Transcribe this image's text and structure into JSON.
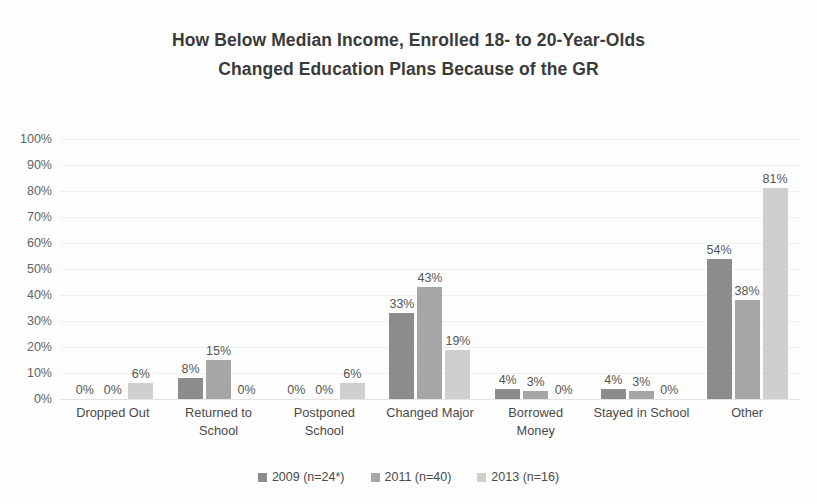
{
  "chart_data": {
    "type": "bar",
    "title": "How Below Median Income, Enrolled 18- to 20-Year-Olds Changed Education Plans Because of the GR",
    "title_lines": [
      "How Below Median Income, Enrolled 18- to 20-Year-Olds",
      "Changed Education Plans Because of the GR"
    ],
    "xlabel": "",
    "ylabel": "",
    "ylim": [
      0,
      100
    ],
    "y_ticks": [
      "100%",
      "90%",
      "80%",
      "70%",
      "60%",
      "50%",
      "40%",
      "30%",
      "20%",
      "10%",
      "0%"
    ],
    "y_tick_values": [
      100,
      90,
      80,
      70,
      60,
      50,
      40,
      30,
      20,
      10,
      0
    ],
    "grid": true,
    "legend_position": "bottom",
    "categories": [
      "Dropped Out",
      "Returned to School",
      "Postponed School",
      "Changed Major",
      "Borrowed Money",
      "Stayed in School",
      "Other"
    ],
    "category_lines": [
      [
        "Dropped Out"
      ],
      [
        "Returned to",
        "School"
      ],
      [
        "Postponed",
        "School"
      ],
      [
        "Changed Major"
      ],
      [
        "Borrowed",
        "Money"
      ],
      [
        "Stayed in School"
      ],
      [
        "Other"
      ]
    ],
    "series": [
      {
        "name": "2009 (n=24*)",
        "color": "#8c8c8c",
        "values": [
          0,
          8,
          0,
          33,
          4,
          4,
          54
        ],
        "labels": [
          "0%",
          "8%",
          "0%",
          "33%",
          "4%",
          "4%",
          "54%"
        ]
      },
      {
        "name": "2011 (n=40)",
        "color": "#a6a6a6",
        "values": [
          0,
          15,
          0,
          43,
          3,
          3,
          38
        ],
        "labels": [
          "0%",
          "15%",
          "0%",
          "43%",
          "3%",
          "3%",
          "38%"
        ]
      },
      {
        "name": "2013 (n=16)",
        "color": "#cfcfcf",
        "values": [
          6,
          0,
          6,
          19,
          0,
          0,
          81
        ],
        "labels": [
          "6%",
          "0%",
          "6%",
          "19%",
          "0%",
          "0%",
          "81%"
        ]
      }
    ]
  },
  "colors": {
    "series_2009": "#8c8c8c",
    "series_2011": "#a6a6a6",
    "series_2013": "#cfcfcf",
    "gridline": "#efefef",
    "text": "#4a4a4a",
    "title": "#3a3a3a",
    "background": "#fefefe"
  }
}
